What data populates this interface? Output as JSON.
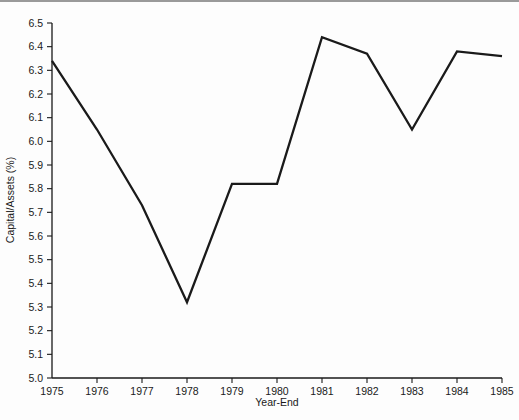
{
  "figure": {
    "background_color": "#fdfdfd",
    "line_color": "#1a1a1a",
    "axis_color": "#1a1a1a",
    "top_rule_color": "#9a9a9a"
  },
  "chart_data": {
    "type": "line",
    "title": "",
    "xlabel": "Year-End",
    "ylabel": "Capital/Assets (%)",
    "x": [
      1975,
      1976,
      1977,
      1978,
      1979,
      1980,
      1981,
      1982,
      1983,
      1984,
      1985
    ],
    "values": [
      6.34,
      6.05,
      5.73,
      5.32,
      5.82,
      5.82,
      6.44,
      6.37,
      6.05,
      6.38,
      6.36
    ],
    "series": [
      {
        "name": "Capital/Assets (%)",
        "values": [
          6.34,
          6.05,
          5.73,
          5.32,
          5.82,
          5.82,
          6.44,
          6.37,
          6.05,
          6.38,
          6.36
        ]
      }
    ],
    "xlim": [
      1975,
      1985
    ],
    "ylim": [
      5.0,
      6.5
    ],
    "xticks": [
      "1975",
      "1976",
      "1977",
      "1978",
      "1979",
      "1980",
      "1981",
      "1982",
      "1983",
      "1984",
      "1985"
    ],
    "yticks": [
      "5.0",
      "5.1",
      "5.2",
      "5.3",
      "5.4",
      "5.5",
      "5.6",
      "5.7",
      "5.8",
      "5.9",
      "6.0",
      "6.1",
      "6.2",
      "6.3",
      "6.4",
      "6.5"
    ],
    "grid": false,
    "legend": false,
    "legend_position": "none"
  }
}
